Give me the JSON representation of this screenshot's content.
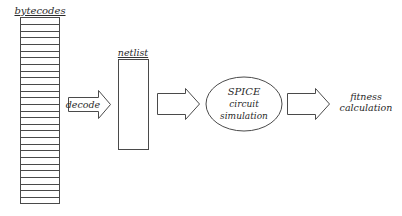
{
  "diagram": {
    "bytecodes": {
      "label": "bytecodes",
      "row_count": 28
    },
    "decode_arrow": {
      "label": "decode"
    },
    "netlist": {
      "label": "netlist"
    },
    "spice": {
      "line1": "SPICE",
      "line2": "circuit",
      "line3": "simulation"
    },
    "fitness": {
      "line1": "fitness",
      "line2": "calculation"
    }
  },
  "colors": {
    "stroke": "#4a4a4a",
    "text": "#2a2a2a",
    "background": "#ffffff"
  }
}
